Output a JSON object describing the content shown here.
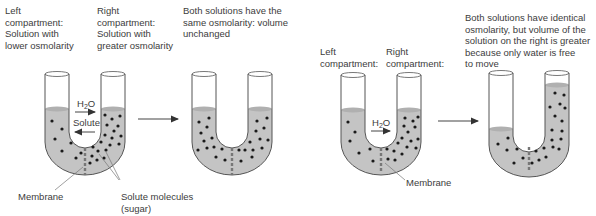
{
  "panel_left": {
    "left_label": "Left\ncompartment:\nSolution with\nlower osmolarity",
    "right_label": "Right\ncompartment:\nSolution with\ngreater osmolarity",
    "result_label": "Both solutions have the\nsame osmolarity: volume\nunchanged",
    "water_label": "H",
    "water_sub": "2",
    "water_o": "O",
    "solute_label": "Solute",
    "membrane_label": "Membrane",
    "solute_molecules_label": "Solute molecules\n(sugar)"
  },
  "panel_right": {
    "left_label": "Left\ncompartment:",
    "right_label": "Right\ncompartment:",
    "result_label": "Both solutions have identical\nosmolarity, but volume of the\nsolution on the right is greater\nbecause only water is free\nto move",
    "water_label": "H",
    "water_sub": "2",
    "water_o": "O",
    "membrane_label": "Membrane"
  },
  "colors": {
    "liquid": "#c4c4c4",
    "tube_outline": "#555555",
    "dot": "#1a1a1a",
    "membrane": "#7a7a7a",
    "arrow": "#444444",
    "text": "#3c3c3c"
  }
}
